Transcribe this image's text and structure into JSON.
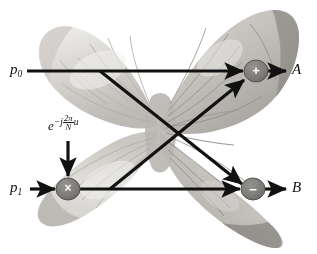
{
  "figure": {
    "type": "fft-butterfly-diagram",
    "background_image": "butterfly-photograph",
    "canvas": {
      "width": 317,
      "height": 254
    },
    "colors": {
      "line": "#111111",
      "node_fill": "#7f7f7f",
      "node_stroke": "#4a4a4a",
      "node_glyph": "#ffffff",
      "wing_light": "#e3e2e0",
      "wing_mid": "#c9c7c3",
      "wing_dark": "#a9a7a2",
      "background": "#ffffff"
    }
  },
  "inputs": [
    {
      "id": "p0",
      "base": "p",
      "sub": "0",
      "x": 10,
      "y": 63
    },
    {
      "id": "p1",
      "base": "p",
      "sub": "1",
      "x": 10,
      "y": 181
    }
  ],
  "outputs": [
    {
      "id": "A",
      "label": "A",
      "x": 292,
      "y": 63
    },
    {
      "id": "B",
      "label": "B",
      "x": 292,
      "y": 181
    }
  ],
  "twiddle": {
    "base": "e",
    "minus": "−",
    "j": "j",
    "numerator": "2π",
    "denominator": "N",
    "power_var": "u",
    "plain": "e^{-j(2π/N)u}",
    "x": 48,
    "y": 119
  },
  "nodes": [
    {
      "id": "mul",
      "glyph": "×",
      "name": "multiply-node",
      "cx": 68,
      "cy": 189,
      "rx": 12,
      "ry": 11
    },
    {
      "id": "plus",
      "glyph": "+",
      "name": "add-node",
      "cx": 256,
      "cy": 71,
      "rx": 12,
      "ry": 11
    },
    {
      "id": "minus",
      "glyph": "−",
      "name": "subtract-node",
      "cx": 253,
      "cy": 189,
      "rx": 12,
      "ry": 11
    }
  ],
  "edges": [
    {
      "id": "p0-to-plus",
      "from": "p0",
      "to": "plus",
      "style": "straight-horizontal"
    },
    {
      "id": "plus-to-A",
      "from": "plus",
      "to": "A",
      "style": "straight-horizontal"
    },
    {
      "id": "p1-to-mul",
      "from": "p1",
      "to": "mul",
      "style": "straight-horizontal"
    },
    {
      "id": "twiddle-to-mul",
      "from": "twiddle",
      "to": "mul",
      "style": "vertical-down"
    },
    {
      "id": "mul-to-minus",
      "from": "mul",
      "to": "minus",
      "style": "straight-horizontal"
    },
    {
      "id": "minus-to-B",
      "from": "minus",
      "to": "B",
      "style": "straight-horizontal"
    },
    {
      "id": "p0line-to-minus",
      "from": "p0-line-tap",
      "to": "minus",
      "style": "diagonal-down"
    },
    {
      "id": "mul-to-plus",
      "from": "mul-line-tap",
      "to": "plus",
      "style": "diagonal-up"
    }
  ],
  "crossing_point": {
    "x": 160,
    "y": 130
  }
}
